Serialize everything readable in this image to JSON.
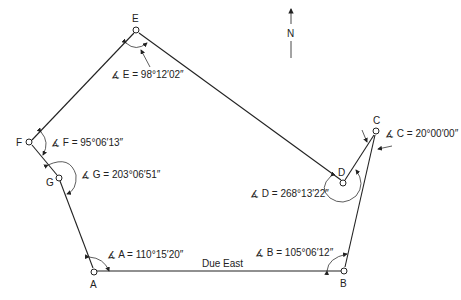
{
  "north_arrow": {
    "label": "N"
  },
  "stations": {
    "A": {
      "label": "A",
      "angle": "∡ A = 110°15′20″"
    },
    "B": {
      "label": "B",
      "angle": "∡ B = 105°06′12″"
    },
    "C": {
      "label": "C",
      "angle": "∡ C = 20°00′00″"
    },
    "D": {
      "label": "D",
      "angle": "∡ D = 268°13′22″"
    },
    "E": {
      "label": "E",
      "angle": "∡ E = 98°12′02″"
    },
    "F": {
      "label": "F",
      "angle": "∡ F = 95°06′13″"
    },
    "G": {
      "label": "G",
      "angle": "∡ G = 203°06′51″"
    }
  },
  "edges": [
    {
      "from": "A",
      "to": "B",
      "label": "Due East"
    },
    {
      "from": "B",
      "to": "C"
    },
    {
      "from": "C",
      "to": "D"
    },
    {
      "from": "D",
      "to": "E"
    },
    {
      "from": "E",
      "to": "F"
    },
    {
      "from": "F",
      "to": "G"
    },
    {
      "from": "G",
      "to": "A"
    }
  ]
}
